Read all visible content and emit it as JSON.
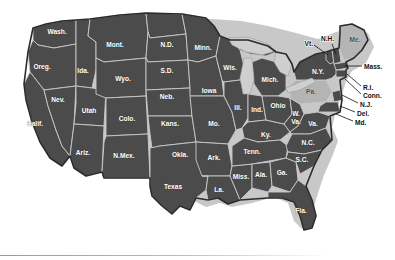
{
  "map": {
    "title": "United States Map",
    "background_color": "#ffffff",
    "state_fill": "#4b4b4b",
    "highlight_fill": "#b4b4b4",
    "border_color": "#c9c9c9",
    "outline_color": "#2b2b2b",
    "lake_fill": "#cfcfcf",
    "shadow_color": "#9a9a9a",
    "label_color": "#ffffff",
    "highlighted_states": [
      "Pa.",
      "Me."
    ],
    "states": [
      {
        "id": "wash",
        "label": "Wash.",
        "x": 57,
        "y": 32,
        "highlight": false
      },
      {
        "id": "oreg",
        "label": "Oreg.",
        "x": 42,
        "y": 67,
        "highlight": false
      },
      {
        "id": "calif",
        "label": "Calif.",
        "x": 35,
        "y": 124,
        "highlight": false
      },
      {
        "id": "nev",
        "label": "Nev.",
        "x": 58,
        "y": 100,
        "highlight": false
      },
      {
        "id": "ida",
        "label": "Ida.",
        "x": 81,
        "y": 71,
        "highlight": false
      },
      {
        "id": "utah",
        "label": "Utah",
        "x": 89,
        "y": 111,
        "highlight": false
      },
      {
        "id": "ariz",
        "label": "Ariz.",
        "x": 81,
        "y": 157,
        "highlight": false
      },
      {
        "id": "mont",
        "label": "Mont.",
        "x": 115,
        "y": 45,
        "highlight": false
      },
      {
        "id": "wyo",
        "label": "Wyo.",
        "x": 123,
        "y": 81,
        "highlight": false
      },
      {
        "id": "colo",
        "label": "Colo.",
        "x": 127,
        "y": 121,
        "highlight": false
      },
      {
        "id": "nmex",
        "label": "N.Mex.",
        "x": 122,
        "y": 158,
        "highlight": false
      },
      {
        "id": "nd",
        "label": "N.D.",
        "x": 168,
        "y": 44,
        "highlight": false
      },
      {
        "id": "sd",
        "label": "S.D.",
        "x": 167,
        "y": 71,
        "highlight": false
      },
      {
        "id": "neb",
        "label": "Neb.",
        "x": 168,
        "y": 98,
        "highlight": false
      },
      {
        "id": "kans",
        "label": "Kans.",
        "x": 172,
        "y": 126,
        "highlight": false
      },
      {
        "id": "okla",
        "label": "Okla.",
        "x": 181,
        "y": 155,
        "highlight": false
      },
      {
        "id": "texas",
        "label": "Texas",
        "x": 171,
        "y": 189,
        "highlight": false
      },
      {
        "id": "minn",
        "label": "Minn.",
        "x": 203,
        "y": 48,
        "highlight": false
      },
      {
        "id": "iowa",
        "label": "Iowa",
        "x": 209,
        "y": 93,
        "highlight": false
      },
      {
        "id": "mo",
        "label": "Mo.",
        "x": 216,
        "y": 126,
        "highlight": false
      },
      {
        "id": "ark",
        "label": "Ark.",
        "x": 219,
        "y": 157,
        "highlight": false
      },
      {
        "id": "la",
        "label": "La.",
        "x": 222,
        "y": 192,
        "highlight": false
      },
      {
        "id": "wis",
        "label": "Wis.",
        "x": 230,
        "y": 68,
        "highlight": false
      },
      {
        "id": "ill",
        "label": "Ill.",
        "x": 240,
        "y": 110,
        "highlight": false
      },
      {
        "id": "miss",
        "label": "Miss.",
        "x": 242,
        "y": 177,
        "highlight": false
      },
      {
        "id": "mich",
        "label": "Mich.",
        "x": 268,
        "y": 82,
        "highlight": false
      },
      {
        "id": "ind",
        "label": "Ind.",
        "x": 258,
        "y": 110,
        "highlight": false
      },
      {
        "id": "ky",
        "label": "Ky.",
        "x": 268,
        "y": 137,
        "highlight": false
      },
      {
        "id": "tenn",
        "label": "Tenn.",
        "x": 254,
        "y": 152,
        "highlight": false
      },
      {
        "id": "ala",
        "label": "Ala.",
        "x": 261,
        "y": 177,
        "highlight": false
      },
      {
        "id": "ohio",
        "label": "Ohio",
        "x": 280,
        "y": 104,
        "highlight": false
      },
      {
        "id": "ga",
        "label": "Ga.",
        "x": 281,
        "y": 175,
        "highlight": false
      },
      {
        "id": "wva",
        "label": "W.",
        "x": 293,
        "y": 117,
        "highlight": false
      },
      {
        "id": "wva2",
        "label": "Va.",
        "x": 293,
        "y": 125,
        "highlight": false
      },
      {
        "id": "va",
        "label": "Va.",
        "x": 311,
        "y": 123,
        "highlight": false
      },
      {
        "id": "nc",
        "label": "N.C.",
        "x": 305,
        "y": 145,
        "highlight": false
      },
      {
        "id": "sc",
        "label": "S.C.",
        "x": 302,
        "y": 163,
        "highlight": false
      },
      {
        "id": "fla",
        "label": "Fla.",
        "x": 300,
        "y": 211,
        "highlight": false
      },
      {
        "id": "pa",
        "label": "Pa.",
        "x": 311,
        "y": 92,
        "highlight": true
      },
      {
        "id": "ny",
        "label": "N.Y.",
        "x": 322,
        "y": 72,
        "highlight": false
      },
      {
        "id": "me",
        "label": "Me.",
        "x": 360,
        "y": 41,
        "highlight": true
      }
    ],
    "callout_labels": [
      {
        "id": "vt",
        "label": "Vt.",
        "x": 312,
        "y": 44,
        "anchor": "end",
        "lx1": 314,
        "ly1": 45,
        "lx2": 322,
        "ly2": 52
      },
      {
        "id": "nh",
        "label": "N.H.",
        "x": 322,
        "y": 40,
        "anchor": "start",
        "lx1": 332,
        "ly1": 43,
        "lx2": 332,
        "ly2": 53
      },
      {
        "id": "mass",
        "label": "Mass.",
        "x": 365,
        "y": 67,
        "anchor": "start",
        "lx1": 345,
        "ly1": 66,
        "lx2": 362,
        "ly2": 66
      },
      {
        "id": "ri",
        "label": "R.I.",
        "x": 364,
        "y": 88,
        "anchor": "start",
        "lx1": 346,
        "ly1": 76,
        "lx2": 362,
        "ly2": 87
      },
      {
        "id": "conn",
        "label": "Conn.",
        "x": 364,
        "y": 96,
        "anchor": "start",
        "lx1": 343,
        "ly1": 80,
        "lx2": 362,
        "ly2": 95
      },
      {
        "id": "nj",
        "label": "N.J.",
        "x": 361,
        "y": 105,
        "anchor": "start",
        "lx1": 340,
        "ly1": 95,
        "lx2": 359,
        "ly2": 104
      },
      {
        "id": "del",
        "label": "Del.",
        "x": 358,
        "y": 114,
        "anchor": "start",
        "lx1": 338,
        "ly1": 106,
        "lx2": 356,
        "ly2": 113
      },
      {
        "id": "md",
        "label": "Md.",
        "x": 356,
        "y": 123,
        "anchor": "start",
        "lx1": 334,
        "ly1": 115,
        "lx2": 354,
        "ly2": 122
      }
    ],
    "lakes": [
      {
        "id": "lake-michigan",
        "label": "Lake Michigan"
      },
      {
        "id": "lake-superior",
        "label": "Lake Superior"
      },
      {
        "id": "lake-huron",
        "label": "Lake Huron"
      },
      {
        "id": "lake-erie",
        "label": "Lake Erie"
      }
    ]
  }
}
